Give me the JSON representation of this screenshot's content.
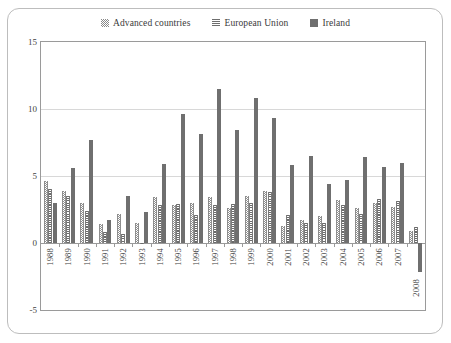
{
  "chart_data": {
    "type": "bar",
    "title": "",
    "subtitle": "",
    "xlabel": "",
    "ylabel": "",
    "grid": true,
    "legend_position": "top-center",
    "ylim": [
      -5,
      15
    ],
    "yticks": [
      "15",
      "10",
      "5",
      "0",
      "-5"
    ],
    "ytick_values": [
      15,
      10,
      5,
      0,
      -5
    ],
    "categories": [
      "1988",
      "1989",
      "1990",
      "1991",
      "1992",
      "1993",
      "1994",
      "1995",
      "1996",
      "1997",
      "1998",
      "1999",
      "2000",
      "2001",
      "2002",
      "2003",
      "2004",
      "2005",
      "2006",
      "2007",
      "2008"
    ],
    "series": [
      {
        "name": "Advanced countries",
        "pattern": "checkered",
        "color": "#8e8e8e",
        "values": [
          4.6,
          3.9,
          3.0,
          1.4,
          2.2,
          1.5,
          3.4,
          2.8,
          3.0,
          3.4,
          2.6,
          3.5,
          3.9,
          1.3,
          1.7,
          2.0,
          3.2,
          2.6,
          3.0,
          2.7,
          0.9
        ]
      },
      {
        "name": "European Union",
        "pattern": "horizontal-stripes",
        "color": "#6b6b6b",
        "values": [
          4.0,
          3.5,
          2.4,
          0.8,
          0.7,
          -0.1,
          2.8,
          2.9,
          2.1,
          2.8,
          2.9,
          3.0,
          3.8,
          2.1,
          1.5,
          1.5,
          2.8,
          2.2,
          3.3,
          3.1,
          1.2
        ]
      },
      {
        "name": "Ireland",
        "pattern": "solid",
        "color": "#6f6f6f",
        "values": [
          3.0,
          5.6,
          7.7,
          1.7,
          3.5,
          2.3,
          5.9,
          9.6,
          8.1,
          11.5,
          8.4,
          10.8,
          9.3,
          5.8,
          6.5,
          4.4,
          4.7,
          6.4,
          5.7,
          6.0,
          -2.2
        ]
      }
    ]
  },
  "legend": {
    "items": [
      {
        "label": "Advanced countries",
        "swatch": "checkered-swatch-icon"
      },
      {
        "label": "European Union",
        "swatch": "striped-swatch-icon"
      },
      {
        "label": "Ireland",
        "swatch": "solid-swatch-icon"
      }
    ]
  },
  "axes": {
    "y_ticks": [
      "15",
      "10",
      "5",
      "0",
      "-5"
    ],
    "x_ticks": [
      "1988",
      "1989",
      "1990",
      "1991",
      "1992",
      "1993",
      "1994",
      "1995",
      "1996",
      "1997",
      "1998",
      "1999",
      "2000",
      "2001",
      "2002",
      "2003",
      "2004",
      "2005",
      "2006",
      "2007",
      "2008"
    ]
  }
}
